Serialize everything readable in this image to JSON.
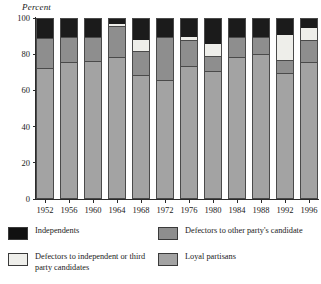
{
  "chart_data": {
    "type": "bar",
    "subtype": "stacked-bar-100-percent",
    "title": "",
    "xlabel": "",
    "ylabel": "Percent",
    "ylim": [
      0,
      100
    ],
    "yticks": [
      0,
      20,
      40,
      60,
      80,
      100
    ],
    "grid": false,
    "legend_position": "bottom",
    "stack_order_bottom_to_top": [
      "Loyal partisans",
      "Defectors to other party's candidate",
      "Defectors to independent or third party candidates",
      "Independents"
    ],
    "categories": [
      "1952",
      "1956",
      "1960",
      "1964",
      "1968",
      "1972",
      "1976",
      "1980",
      "1984",
      "1988",
      "1992",
      "1996"
    ],
    "series": [
      {
        "name": "Loyal partisans",
        "color": "#a3a3a3",
        "values": [
          73,
          76,
          77,
          79,
          69,
          66,
          74,
          71,
          79,
          81,
          70,
          76
        ]
      },
      {
        "name": "Defectors to other party's candidate",
        "color": "#8e8e8e",
        "values": [
          16,
          14,
          13,
          17,
          13,
          24,
          14,
          8,
          11,
          9,
          7,
          12
        ]
      },
      {
        "name": "Defectors to independent or third party candidates",
        "color": "#eeeeea",
        "values": [
          0,
          0,
          0,
          1,
          6,
          0,
          2,
          7,
          0,
          0,
          14,
          7
        ]
      },
      {
        "name": "Independents",
        "color": "#1b1b1b",
        "values": [
          11,
          10,
          10,
          3,
          12,
          10,
          10,
          14,
          10,
          10,
          9,
          5
        ]
      }
    ]
  },
  "axis": {
    "y_title": "Percent",
    "y_tick_labels": [
      "100",
      "80",
      "60",
      "40",
      "20",
      "0"
    ],
    "x_tick_labels": [
      "1952",
      "1956",
      "1960",
      "1964",
      "1968",
      "1972",
      "1976",
      "1980",
      "1984",
      "1988",
      "1992",
      "1996"
    ]
  },
  "legend": {
    "items": [
      {
        "label": "Independents",
        "swatch": "independents-swatch",
        "color": "#1b1b1b"
      },
      {
        "label": "Defectors to other party's candidate",
        "swatch": "other-party-swatch",
        "color": "#8e8e8e"
      },
      {
        "label": "Defectors to independent or third party candidates",
        "swatch": "third-party-swatch",
        "color": "#eeeeea"
      },
      {
        "label": "Loyal partisans",
        "swatch": "loyal-partisans-swatch",
        "color": "#a3a3a3"
      }
    ]
  }
}
